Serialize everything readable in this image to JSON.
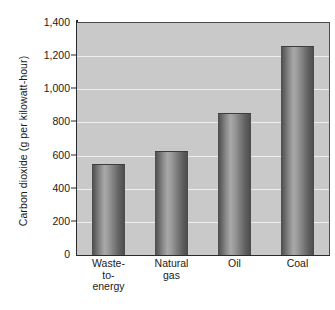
{
  "chart_data": {
    "type": "bar",
    "title": "",
    "subtitle": "",
    "xlabel": "",
    "ylabel": "Carbon dioxide (g per kilowatt-hour)",
    "categories": [
      "Waste-to-energy",
      "Natural gas",
      "Oil",
      "Coal"
    ],
    "category_lines": [
      [
        "Waste-",
        "to-",
        "energy"
      ],
      [
        "Natural",
        "gas"
      ],
      [
        "Oil"
      ],
      [
        "Coal"
      ]
    ],
    "values": [
      550,
      630,
      855,
      1260
    ],
    "ylim": [
      0,
      1400
    ],
    "ytick_values": [
      0,
      200,
      400,
      600,
      800,
      1000,
      1200,
      1400
    ],
    "ytick_labels": [
      "0",
      "200",
      "400",
      "600",
      "800",
      "1,000",
      "1,200",
      "1,400"
    ],
    "grid": true,
    "grid_axis": "y",
    "legend": "none",
    "legend_position": "none",
    "colors": {
      "plot_background": "#c9c9c9",
      "gridline": "#eeeeee",
      "axis": "#2b2b2b",
      "bar_dark": "#4a4a4a",
      "bar_light": "#a8a8a8",
      "text": "#1a1a1a",
      "page_background": "#ffffff"
    }
  }
}
